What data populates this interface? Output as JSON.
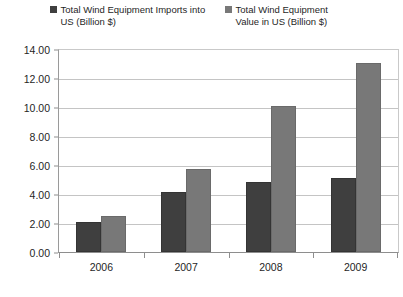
{
  "chart_data": {
    "type": "bar",
    "title": "",
    "subtitle": "",
    "xlabel": "",
    "ylabel": "",
    "categories": [
      "2006",
      "2007",
      "2008",
      "2009"
    ],
    "series": [
      {
        "name": "Total Wind Equipment Imports into US (Billion $)",
        "color": "#3f3f3f",
        "values": [
          2.05,
          4.12,
          4.85,
          5.1
        ]
      },
      {
        "name": "Total Wind Equipment Value in US (Billion $)",
        "color": "#787878",
        "values": [
          2.45,
          5.7,
          10.08,
          13.05
        ]
      }
    ],
    "ylim": [
      0.0,
      14.0
    ],
    "ytick_values": [
      0.0,
      2.0,
      4.0,
      6.0,
      8.0,
      10.0,
      12.0,
      14.0
    ],
    "ytick_labels": [
      "0.00",
      "2.00",
      "4.00",
      "6.00",
      "8.00",
      "10.00",
      "12.00",
      "14.00"
    ],
    "grid": true,
    "grid_axis": "y",
    "legend_position": "top",
    "legend": [
      {
        "label": "Total Wind Equipment Imports into US (Billion $)",
        "color": "#3f3f3f",
        "marker": "square-swatch"
      },
      {
        "label": "Total Wind Equipment Value in US (Billion $)",
        "color": "#787878",
        "marker": "square-swatch"
      }
    ],
    "plot_background": "#ffffff",
    "grid_color": "#c4c4c4",
    "axis_color": "#8e8e8e"
  }
}
